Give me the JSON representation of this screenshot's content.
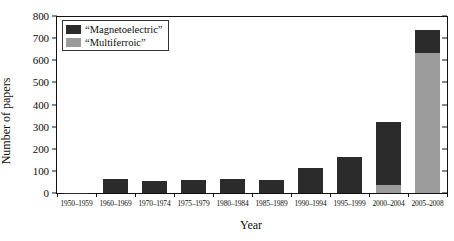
{
  "chart_data": {
    "type": "bar",
    "title": "",
    "subtitle": "",
    "stacked": true,
    "xlabel": "Year",
    "ylabel": "Number of papers",
    "categories": [
      "1950–1959",
      "1960–1969",
      "1970–1974",
      "1975–1979",
      "1980–1984",
      "1985–1989",
      "1990–1994",
      "1995–1999",
      "2000–2004",
      "2005–2008"
    ],
    "series": [
      {
        "name": "“Magnetoelectric”",
        "color": "#2b2b2b",
        "values": [
          2,
          65,
          55,
          58,
          64,
          59,
          113,
          161,
          285,
          103
        ]
      },
      {
        "name": "“Multiferroic”",
        "color": "#9b9b9b",
        "values": [
          0,
          0,
          0,
          0,
          0,
          0,
          0,
          0,
          35,
          635
        ]
      }
    ],
    "totals": [
      2,
      65,
      55,
      58,
      64,
      59,
      113,
      161,
      320,
      738
    ],
    "ylim": [
      0,
      800
    ],
    "yticks": [
      0,
      100,
      200,
      300,
      400,
      500,
      600,
      700,
      800
    ],
    "ytick_labels": [
      "0",
      "100",
      "200",
      "300",
      "400",
      "500",
      "600",
      "700",
      "800"
    ],
    "grid": false,
    "legend_position": "top-left",
    "legend": [
      "“Magnetoelectric”",
      "“Multiferroic”"
    ]
  }
}
